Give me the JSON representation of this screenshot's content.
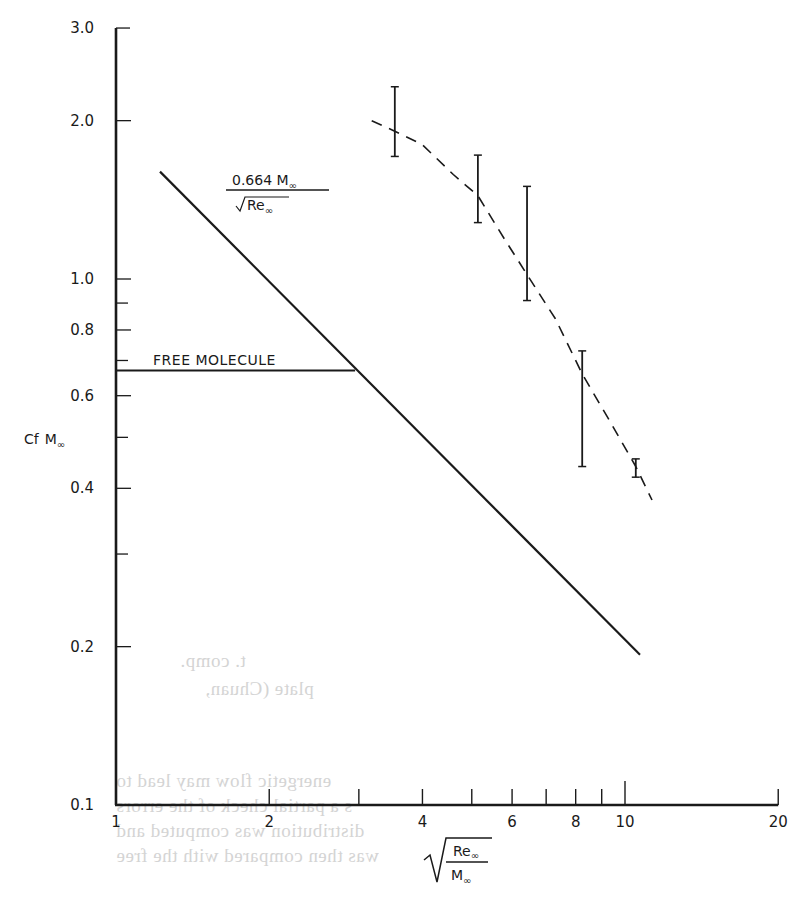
{
  "chart_data": {
    "type": "line",
    "title": "",
    "xlabel": "sqrt(Re∞ / M∞)",
    "ylabel": "Cf M∞",
    "xscale": "log",
    "yscale": "log",
    "xlim": [
      1,
      20
    ],
    "ylim": [
      0.1,
      3.0
    ],
    "grid": false,
    "legend": null,
    "x_ticks": [
      {
        "v": 1,
        "label": "1"
      },
      {
        "v": 2,
        "label": "2"
      },
      {
        "v": 3,
        "label": ""
      },
      {
        "v": 4,
        "label": "4"
      },
      {
        "v": 5,
        "label": ""
      },
      {
        "v": 6,
        "label": "6"
      },
      {
        "v": 7,
        "label": ""
      },
      {
        "v": 8,
        "label": "8"
      },
      {
        "v": 9,
        "label": ""
      },
      {
        "v": 10,
        "label": "10"
      },
      {
        "v": 20,
        "label": "20"
      }
    ],
    "y_ticks": [
      {
        "v": 0.1,
        "label": "0.1"
      },
      {
        "v": 0.2,
        "label": "0.2"
      },
      {
        "v": 0.3,
        "label": ""
      },
      {
        "v": 0.4,
        "label": "0.4"
      },
      {
        "v": 0.5,
        "label": ""
      },
      {
        "v": 0.6,
        "label": "0.6"
      },
      {
        "v": 0.7,
        "label": ""
      },
      {
        "v": 0.8,
        "label": "0.8"
      },
      {
        "v": 0.9,
        "label": ""
      },
      {
        "v": 1.0,
        "label": "1.0"
      },
      {
        "v": 2.0,
        "label": "2.0"
      },
      {
        "v": 3.0,
        "label": "3.0"
      }
    ],
    "series": [
      {
        "name": "0.664 M∞ / sqrt(Re∞)",
        "style": "solid",
        "x": [
          1.22,
          10.7
        ],
        "y": [
          1.6,
          0.193
        ]
      },
      {
        "name": "FREE MOLECULE",
        "style": "solid",
        "x": [
          1.0,
          2.95
        ],
        "y": [
          0.67,
          0.67
        ]
      },
      {
        "name": "experimental trend",
        "style": "dashed",
        "x": [
          3.18,
          3.53,
          4.0,
          4.6,
          5.14,
          5.8,
          6.42,
          7.3,
          8.24,
          9.3,
          10.5,
          11.3
        ],
        "y": [
          2.0,
          1.91,
          1.8,
          1.58,
          1.44,
          1.19,
          1.02,
          0.84,
          0.66,
          0.54,
          0.44,
          0.38
        ]
      }
    ],
    "error_bars": [
      {
        "x": 3.53,
        "low": 1.71,
        "high": 2.32
      },
      {
        "x": 5.14,
        "low": 1.28,
        "high": 1.72
      },
      {
        "x": 6.42,
        "low": 0.91,
        "high": 1.5
      },
      {
        "x": 8.24,
        "low": 0.44,
        "high": 0.73
      },
      {
        "x": 10.5,
        "low": 0.42,
        "high": 0.455
      }
    ],
    "annotations": [
      {
        "text": "FREE MOLECULE",
        "x": 1.23,
        "y": 0.69
      },
      {
        "text": "0.664 M∞ / sqrt(Re∞)",
        "x": 2.0,
        "y": 1.75
      }
    ]
  },
  "labels": {
    "y_axis": {
      "main": "Cf",
      "sub": "f",
      "m": "M",
      "inf": "∞"
    },
    "x_axis": {
      "num": "Re",
      "den": "M",
      "inf": "∞"
    },
    "formula": {
      "num": "0.664 M",
      "den": "Re",
      "inf": "∞"
    },
    "free_molecule": "FREE MOLECULE"
  },
  "bleed_through": [
    {
      "text": "t. comp.",
      "x": 180,
      "y": 650
    },
    {
      "text": "plate (Chuan,",
      "x": 205,
      "y": 678
    },
    {
      "text": "energetic flow may lead to",
      "x": 116,
      "y": 770
    },
    {
      "text": "s a partial check of the errors",
      "x": 116,
      "y": 795
    },
    {
      "text": "distribution was computed and",
      "x": 116,
      "y": 820
    },
    {
      "text": "was then compared with the free",
      "x": 116,
      "y": 845
    }
  ]
}
